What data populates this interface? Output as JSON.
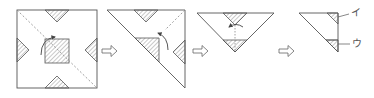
{
  "diagram": {
    "type": "origami-folding-steps",
    "steps": [
      {
        "id": 1,
        "shape": "square",
        "description": "Square paper with four hatched corner triangles at edge midpoints, hatched center square, dashed diagonal fold line and curved fold arrow"
      },
      {
        "id": 2,
        "shape": "right-triangle",
        "description": "Folded in half along diagonal; hatched triangles visible, dashed fold line, curved arrow"
      },
      {
        "id": 3,
        "shape": "inverted-triangle",
        "description": "Folded again; hatched regions at top center and bottom tip, dashed vertical center line, curved arrow"
      },
      {
        "id": 4,
        "shape": "right-triangle",
        "description": "Final folded shape with two labeled hatched regions"
      }
    ],
    "arrows": [
      {
        "from": 1,
        "to": 2,
        "style": "outline-right-arrow"
      },
      {
        "from": 2,
        "to": 3,
        "style": "outline-right-arrow"
      },
      {
        "from": 3,
        "to": 4,
        "style": "outline-right-arrow"
      }
    ],
    "labels": [
      {
        "text": "イ",
        "step": 4,
        "position": "upper-right"
      },
      {
        "text": "ウ",
        "step": 4,
        "position": "lower-right"
      }
    ],
    "colors": {
      "line": "#555555",
      "hatch": "#777777",
      "dashed": "#888888",
      "background": "#ffffff"
    }
  }
}
